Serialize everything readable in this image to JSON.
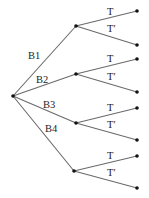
{
  "diagram": {
    "type": "probability-tree",
    "root": {
      "x": 13,
      "y": 96
    },
    "first_level": [
      {
        "label": "B1",
        "node": {
          "x": 76,
          "y": 26
        },
        "label_pos": {
          "x": 28,
          "y": 59
        }
      },
      {
        "label": "B2",
        "node": {
          "x": 76,
          "y": 74
        },
        "label_pos": {
          "x": 36,
          "y": 83
        }
      },
      {
        "label": "B3",
        "node": {
          "x": 76,
          "y": 123
        },
        "label_pos": {
          "x": 43,
          "y": 108
        }
      },
      {
        "label": "B4",
        "node": {
          "x": 74,
          "y": 171
        },
        "label_pos": {
          "x": 45,
          "y": 132
        }
      }
    ],
    "second_level": [
      {
        "parent": 0,
        "label": "T",
        "leaf": {
          "x": 137,
          "y": 11
        },
        "label_pos": {
          "x": 107,
          "y": 15
        }
      },
      {
        "parent": 0,
        "label": "T′",
        "leaf": {
          "x": 137,
          "y": 45
        },
        "label_pos": {
          "x": 107,
          "y": 32
        }
      },
      {
        "parent": 1,
        "label": "T",
        "leaf": {
          "x": 137,
          "y": 59
        },
        "label_pos": {
          "x": 107,
          "y": 62
        }
      },
      {
        "parent": 1,
        "label": "T′",
        "leaf": {
          "x": 137,
          "y": 92
        },
        "label_pos": {
          "x": 107,
          "y": 80
        }
      },
      {
        "parent": 2,
        "label": "T",
        "leaf": {
          "x": 137,
          "y": 108
        },
        "label_pos": {
          "x": 107,
          "y": 111
        }
      },
      {
        "parent": 2,
        "label": "T′",
        "leaf": {
          "x": 137,
          "y": 140
        },
        "label_pos": {
          "x": 107,
          "y": 128
        }
      },
      {
        "parent": 3,
        "label": "T",
        "leaf": {
          "x": 137,
          "y": 156
        },
        "label_pos": {
          "x": 107,
          "y": 159
        }
      },
      {
        "parent": 3,
        "label": "T′",
        "leaf": {
          "x": 137,
          "y": 188
        },
        "label_pos": {
          "x": 107,
          "y": 176
        }
      }
    ]
  }
}
